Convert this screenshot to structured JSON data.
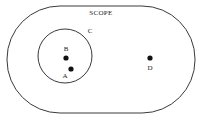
{
  "diagram": {
    "type": "set-diagram",
    "width": 202,
    "height": 121,
    "background_color": "#ffffff",
    "stroke_color": "#3a3a3a",
    "dot_color": "#111111",
    "scope": {
      "label": "SCOPE",
      "shape": "rounded-stadium",
      "label_x": 101,
      "label_y": 13,
      "x": 7,
      "y": 6,
      "w": 188,
      "h": 107,
      "corner_radius": 53
    },
    "inner_set": {
      "label": "C",
      "shape": "circle",
      "cx": 65,
      "cy": 56,
      "r": 27,
      "label_x": 90,
      "label_y": 31
    },
    "points": [
      {
        "id": "B",
        "label": "B",
        "cx": 66,
        "cy": 58,
        "r": 2.6,
        "label_x": 66,
        "label_y": 49,
        "inside": "inner_set"
      },
      {
        "id": "A",
        "label": "A",
        "cx": 71,
        "cy": 69,
        "r": 2.6,
        "label_x": 65,
        "label_y": 76,
        "inside": "inner_set"
      },
      {
        "id": "D",
        "label": "D",
        "cx": 150,
        "cy": 58,
        "r": 2.6,
        "label_x": 150,
        "label_y": 68,
        "inside": "scope"
      }
    ]
  }
}
